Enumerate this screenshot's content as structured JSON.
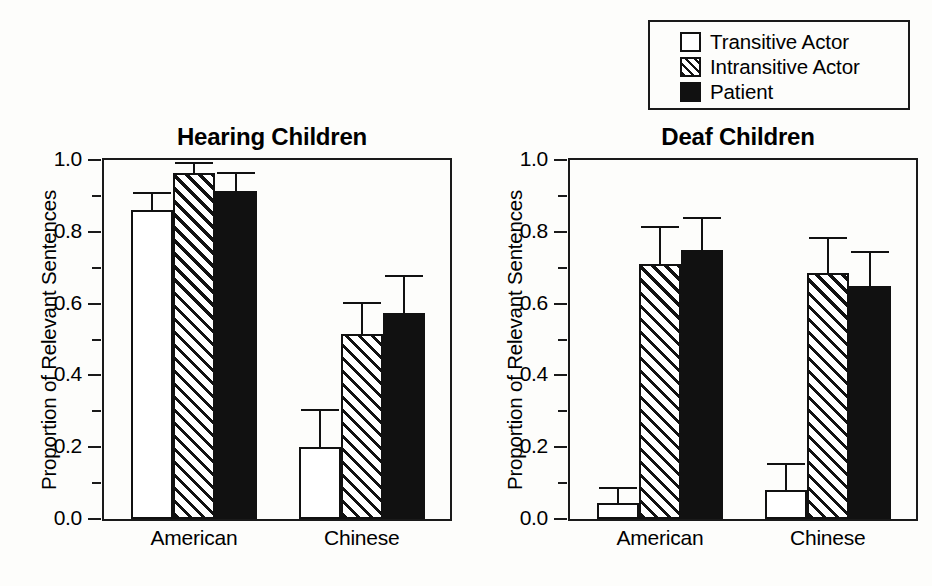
{
  "figure": {
    "legend": {
      "position": "top-right",
      "items": [
        {
          "label": "Transitive Actor",
          "swatch": "open-square-icon"
        },
        {
          "label": "Intransitive Actor",
          "swatch": "hatched-square-icon"
        },
        {
          "label": "Patient",
          "swatch": "filled-square-icon"
        }
      ]
    }
  },
  "chart_data": [
    {
      "type": "bar",
      "title": "Hearing Children",
      "xlabel": "",
      "ylabel": "Proportion of Relevant Sentences",
      "ylim": [
        0.0,
        1.0
      ],
      "yticks": [
        "0.0",
        "0.2",
        "0.4",
        "0.6",
        "0.8",
        "1.0"
      ],
      "ytick_values": [
        0.0,
        0.2,
        0.4,
        0.6,
        0.8,
        1.0
      ],
      "minor_ytick_values": [
        0.1,
        0.3,
        0.5,
        0.7,
        0.9
      ],
      "grid": false,
      "categories": [
        "American",
        "Chinese"
      ],
      "series": [
        {
          "name": "Transitive Actor",
          "values": [
            0.86,
            0.2
          ],
          "errors": [
            0.045,
            0.1
          ]
        },
        {
          "name": "Intransitive Actor",
          "values": [
            0.965,
            0.515
          ],
          "errors": [
            0.025,
            0.085
          ]
        },
        {
          "name": "Patient",
          "values": [
            0.915,
            0.575
          ],
          "errors": [
            0.045,
            0.1
          ]
        }
      ]
    },
    {
      "type": "bar",
      "title": "Deaf Children",
      "xlabel": "",
      "ylabel": "Proportion of Relevant Sentences",
      "ylim": [
        0.0,
        1.0
      ],
      "yticks": [
        "0.0",
        "0.2",
        "0.4",
        "0.6",
        "0.8",
        "1.0"
      ],
      "ytick_values": [
        0.0,
        0.2,
        0.4,
        0.6,
        0.8,
        1.0
      ],
      "minor_ytick_values": [
        0.1,
        0.3,
        0.5,
        0.7,
        0.9
      ],
      "grid": false,
      "categories": [
        "American",
        "Chinese"
      ],
      "series": [
        {
          "name": "Transitive Actor",
          "values": [
            0.045,
            0.08
          ],
          "errors": [
            0.04,
            0.07
          ]
        },
        {
          "name": "Intransitive Actor",
          "values": [
            0.71,
            0.685
          ],
          "errors": [
            0.1,
            0.095
          ]
        },
        {
          "name": "Patient",
          "values": [
            0.75,
            0.65
          ],
          "errors": [
            0.085,
            0.09
          ]
        }
      ]
    }
  ]
}
